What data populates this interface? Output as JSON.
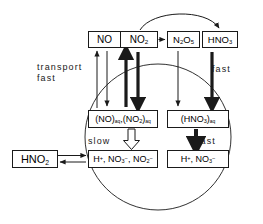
{
  "diagram": {
    "type": "flow-diagram",
    "background": "#ffffff",
    "ink": "#1a1a1a"
  },
  "gas_phase": {
    "boxes": [
      {
        "id": "no",
        "label": "NO",
        "formula": "NO"
      },
      {
        "id": "no2",
        "label": "NO2",
        "formula": "NO2"
      },
      {
        "id": "n2o5",
        "label": "N2O5",
        "formula": "N2O5"
      },
      {
        "id": "hno3",
        "label": "HNO3",
        "formula": "HNO3"
      }
    ]
  },
  "aqueous_phase": {
    "droplet": {
      "name": "cloud-droplet",
      "shape": "circle"
    },
    "dissolved": [
      {
        "id": "no-no2-aq",
        "label": "(NO)aq, (NO2)aq"
      },
      {
        "id": "hno3-aq",
        "label": "(HNO3)aq"
      }
    ],
    "ions": [
      {
        "id": "ions-left",
        "label": "H+, NO3-, NO2-"
      },
      {
        "id": "ions-right",
        "label": "H+, NO3-"
      }
    ]
  },
  "nitrous_acid": {
    "id": "hno2",
    "label": "HNO2"
  },
  "labels": {
    "transport_line1": "transport",
    "transport_line2": "fast",
    "fast_right": "fast",
    "slow": "slow",
    "fast_mid": "fast"
  },
  "arrows": [
    {
      "name": "no2-to-n2o5-arrow",
      "style": "thin",
      "direction": "right"
    },
    {
      "name": "no2-to-hno3-arc-arrow",
      "style": "curved",
      "direction": "right"
    },
    {
      "name": "no-uptake-down-arrow",
      "style": "thin",
      "direction": "down"
    },
    {
      "name": "no-release-up-arrow",
      "style": "thin",
      "direction": "up"
    },
    {
      "name": "no2-release-up-arrow",
      "style": "thick",
      "direction": "up"
    },
    {
      "name": "no2-uptake-down-arrow",
      "style": "thick",
      "direction": "down"
    },
    {
      "name": "n2o5-uptake-down-arrow",
      "style": "thin",
      "direction": "down"
    },
    {
      "name": "hno3-uptake-down-arrow",
      "style": "thick",
      "direction": "down"
    },
    {
      "name": "slow-dissociation-arrow",
      "style": "hollow",
      "direction": "down"
    },
    {
      "name": "fast-dissociation-arrow",
      "style": "thick",
      "direction": "down"
    },
    {
      "name": "hno2-forward-arrow",
      "style": "thin",
      "direction": "right"
    },
    {
      "name": "hno2-reverse-arrow",
      "style": "thin",
      "direction": "left"
    }
  ]
}
